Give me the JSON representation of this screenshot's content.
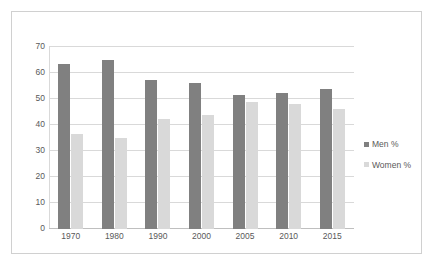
{
  "chart_data": {
    "type": "bar",
    "title": "",
    "subtitle": "",
    "xlabel": "",
    "ylabel": "",
    "categories": [
      "1970",
      "1980",
      "1990",
      "2000",
      "2005",
      "2010",
      "2015"
    ],
    "series": [
      {
        "name": "Men %",
        "color": "#808080",
        "values": [
          63.5,
          65.0,
          57.5,
          56.0,
          51.5,
          52.3,
          54.0
        ]
      },
      {
        "name": "Women %",
        "color": "#d9d9d9",
        "values": [
          36.5,
          35.0,
          42.3,
          43.8,
          48.7,
          48.0,
          46.3
        ]
      }
    ],
    "ylim": [
      0,
      70
    ],
    "yticks": [
      0,
      10,
      20,
      30,
      40,
      50,
      60,
      70
    ],
    "ytick_labels": [
      "0",
      "10",
      "20",
      "30",
      "40",
      "50",
      "60",
      "70"
    ],
    "grid": "horizontal",
    "legend_position": "right",
    "legend_entries": [
      "Men %",
      "Women %"
    ]
  },
  "colors": {
    "men": "#808080",
    "women": "#d9d9d9",
    "gridline": "#d9d9d9",
    "axis_text": "#595959",
    "frame_border": "#d0d0d0",
    "plot_background": "#ffffff"
  }
}
